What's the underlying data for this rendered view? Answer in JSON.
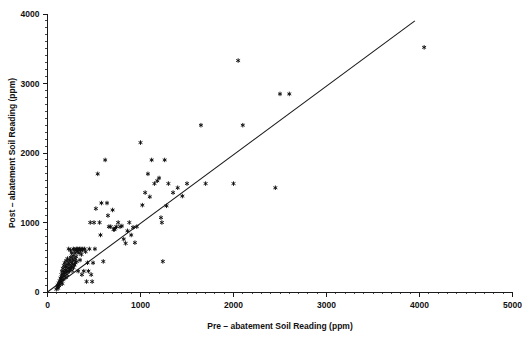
{
  "chart_data": {
    "type": "scatter",
    "title": "",
    "xlabel": "Pre – abatement Soil Reading (ppm)",
    "ylabel": "Post – abatement Soil Reading (ppm)",
    "xlim": [
      0,
      5000
    ],
    "ylim": [
      0,
      4000
    ],
    "xticks": [
      0,
      1000,
      2000,
      3000,
      4000,
      5000
    ],
    "yticks": [
      0,
      1000,
      2000,
      3000,
      4000
    ],
    "xtick_labels": [
      "0",
      "1000",
      "2000",
      "3000",
      "4000",
      "5000"
    ],
    "ytick_labels": [
      "0",
      "1000",
      "2000",
      "3000",
      "4000"
    ],
    "minor_ticks_per_interval": 10,
    "grid": false,
    "legend": null,
    "marker_style": "asterisk",
    "marker_color": "#0d0d0d",
    "series": [
      {
        "name": "Soil readings",
        "points": [
          [
            95,
            40
          ],
          [
            105,
            70
          ],
          [
            110,
            100
          ],
          [
            115,
            55
          ],
          [
            120,
            130
          ],
          [
            125,
            90
          ],
          [
            130,
            160
          ],
          [
            135,
            110
          ],
          [
            140,
            200
          ],
          [
            145,
            145
          ],
          [
            150,
            250
          ],
          [
            152,
            180
          ],
          [
            155,
            300
          ],
          [
            158,
            215
          ],
          [
            160,
            120
          ],
          [
            165,
            340
          ],
          [
            168,
            260
          ],
          [
            170,
            180
          ],
          [
            175,
            380
          ],
          [
            178,
            290
          ],
          [
            180,
            230
          ],
          [
            185,
            420
          ],
          [
            188,
            320
          ],
          [
            190,
            270
          ],
          [
            195,
            360
          ],
          [
            198,
            210
          ],
          [
            200,
            450
          ],
          [
            205,
            300
          ],
          [
            208,
            390
          ],
          [
            210,
            250
          ],
          [
            215,
            480
          ],
          [
            218,
            340
          ],
          [
            220,
            290
          ],
          [
            225,
            420
          ],
          [
            228,
            620
          ],
          [
            230,
            350
          ],
          [
            235,
            300
          ],
          [
            238,
            460
          ],
          [
            240,
            390
          ],
          [
            245,
            330
          ],
          [
            248,
            600
          ],
          [
            250,
            500
          ],
          [
            255,
            430
          ],
          [
            258,
            360
          ],
          [
            260,
            560
          ],
          [
            265,
            310
          ],
          [
            268,
            470
          ],
          [
            270,
            400
          ],
          [
            275,
            520
          ],
          [
            278,
            620
          ],
          [
            280,
            350
          ],
          [
            285,
            450
          ],
          [
            288,
            610
          ],
          [
            290,
            390
          ],
          [
            295,
            560
          ],
          [
            298,
            480
          ],
          [
            300,
            420
          ],
          [
            305,
            600
          ],
          [
            308,
            510
          ],
          [
            310,
            620
          ],
          [
            315,
            440
          ],
          [
            320,
            580
          ],
          [
            325,
            620
          ],
          [
            330,
            300
          ],
          [
            335,
            610
          ],
          [
            340,
            560
          ],
          [
            345,
            620
          ],
          [
            350,
            460
          ],
          [
            355,
            600
          ],
          [
            360,
            620
          ],
          [
            365,
            540
          ],
          [
            370,
            250
          ],
          [
            375,
            600
          ],
          [
            380,
            620
          ],
          [
            390,
            300
          ],
          [
            400,
            620
          ],
          [
            410,
            580
          ],
          [
            420,
            150
          ],
          [
            430,
            420
          ],
          [
            440,
            300
          ],
          [
            450,
            620
          ],
          [
            460,
            1000
          ],
          [
            470,
            250
          ],
          [
            480,
            150
          ],
          [
            490,
            420
          ],
          [
            500,
            1000
          ],
          [
            510,
            620
          ],
          [
            520,
            1200
          ],
          [
            540,
            1700
          ],
          [
            560,
            1000
          ],
          [
            570,
            820
          ],
          [
            580,
            1280
          ],
          [
            600,
            440
          ],
          [
            620,
            1900
          ],
          [
            640,
            1280
          ],
          [
            650,
            1100
          ],
          [
            660,
            940
          ],
          [
            680,
            940
          ],
          [
            700,
            1180
          ],
          [
            710,
            900
          ],
          [
            720,
            900
          ],
          [
            730,
            920
          ],
          [
            740,
            940
          ],
          [
            760,
            1000
          ],
          [
            780,
            940
          ],
          [
            800,
            950
          ],
          [
            820,
            760
          ],
          [
            840,
            700
          ],
          [
            860,
            880
          ],
          [
            880,
            1000
          ],
          [
            900,
            820
          ],
          [
            920,
            930
          ],
          [
            940,
            710
          ],
          [
            960,
            940
          ],
          [
            1000,
            2150
          ],
          [
            1020,
            1250
          ],
          [
            1050,
            1430
          ],
          [
            1080,
            1700
          ],
          [
            1100,
            1370
          ],
          [
            1120,
            1900
          ],
          [
            1150,
            1560
          ],
          [
            1180,
            1600
          ],
          [
            1200,
            1640
          ],
          [
            1220,
            1070
          ],
          [
            1230,
            1000
          ],
          [
            1240,
            440
          ],
          [
            1260,
            1900
          ],
          [
            1280,
            1240
          ],
          [
            1300,
            1560
          ],
          [
            1350,
            1430
          ],
          [
            1400,
            1500
          ],
          [
            1450,
            1380
          ],
          [
            1500,
            1560
          ],
          [
            1650,
            2400
          ],
          [
            1700,
            1560
          ],
          [
            2000,
            1560
          ],
          [
            2050,
            3330
          ],
          [
            2100,
            2400
          ],
          [
            2450,
            1500
          ],
          [
            2500,
            2850
          ],
          [
            2600,
            2850
          ],
          [
            4050,
            3520
          ]
        ]
      }
    ],
    "fit_line": {
      "type": "linear",
      "x_start": 0,
      "y_start": 0,
      "x_end": 3950,
      "y_end": 3900
    }
  }
}
